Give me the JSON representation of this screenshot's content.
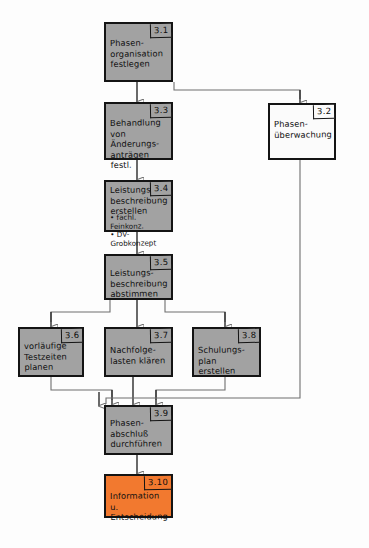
{
  "diagram": {
    "colors": {
      "node_fill_gray": "#a2a2a2",
      "node_fill_white": "#fbfbfb",
      "node_fill_orange": "#f2792f",
      "node_border": "#141414",
      "wire": "#6f6f6f",
      "background": "#fdfdfd"
    },
    "nodes": [
      {
        "id": "n31",
        "number": "3.1",
        "label": "Phasen-\norganisation\nfestlegen",
        "bullets": "",
        "fill": "gray"
      },
      {
        "id": "n32",
        "number": "3.2",
        "label": "Phasen-\nüberwachung",
        "bullets": "",
        "fill": "white"
      },
      {
        "id": "n33",
        "number": "3.3",
        "label": "Behandlung\nvon Änderungs-\nanträgen festl.",
        "bullets": "",
        "fill": "gray"
      },
      {
        "id": "n34",
        "number": "3.4",
        "label": "Leistungs-\nbeschreibung\nerstellen",
        "bullets": "• fachl. Feinkonz.\n• DV-Grobkonzept",
        "fill": "gray"
      },
      {
        "id": "n35",
        "number": "3.5",
        "label": "Leistungs-\nbeschreibung\nabstimmen",
        "bullets": "",
        "fill": "gray"
      },
      {
        "id": "n36",
        "number": "3.6",
        "label": "vorläufige\nTestzeiten\nplanen",
        "bullets": "",
        "fill": "gray"
      },
      {
        "id": "n37",
        "number": "3.7",
        "label": "Nachfolge-\nlasten klären",
        "bullets": "",
        "fill": "gray"
      },
      {
        "id": "n38",
        "number": "3.8",
        "label": "Schulungs-\nplan erstellen",
        "bullets": "",
        "fill": "gray"
      },
      {
        "id": "n39",
        "number": "3.9",
        "label": "Phasen-\nabschluß\ndurchführen",
        "bullets": "",
        "fill": "gray"
      },
      {
        "id": "n310",
        "number": "3.10",
        "label": "Information u.\nEntscheidung",
        "bullets": "",
        "fill": "orange"
      }
    ]
  }
}
